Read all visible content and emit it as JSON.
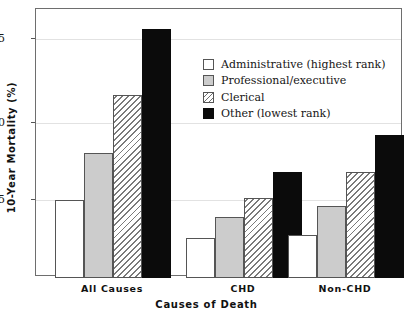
{
  "chart_data": {
    "type": "bar",
    "title": "",
    "xlabel": "Causes of Death",
    "ylabel": "10-Year Mortality (%)",
    "categories": [
      "All Causes",
      "CHD",
      "Non-CHD"
    ],
    "series": [
      {
        "name": "Administrative (highest rank)",
        "color": "#ffffff",
        "fill": "solid-white",
        "values": [
          4.9,
          2.5,
          2.7
        ]
      },
      {
        "name": "Professional/executive",
        "color": "#cccccc",
        "fill": "solid-gray",
        "values": [
          7.8,
          3.8,
          4.5
        ]
      },
      {
        "name": "Clerical",
        "color": "#ffffff",
        "fill": "diagonal-hatch",
        "values": [
          11.4,
          5.0,
          6.6
        ]
      },
      {
        "name": "Other (lowest rank)",
        "color": "#0b0b0b",
        "fill": "solid-black",
        "values": [
          15.5,
          6.6,
          8.9
        ]
      }
    ],
    "ylim": [
      0,
      16.7
    ],
    "yticks": [
      5,
      10,
      15
    ],
    "ytick_labels": [
      "5",
      "10",
      "15"
    ],
    "grid": "horizontal-only",
    "legend_position": "upper-center"
  },
  "legend": {
    "entries": [
      {
        "label": "Administrative (highest rank)",
        "swatch": "admin"
      },
      {
        "label": "Professional/executive",
        "swatch": "prof"
      },
      {
        "label": "Clerical",
        "swatch": "cler"
      },
      {
        "label": "Other (lowest rank)",
        "swatch": "other"
      }
    ]
  },
  "axes": {
    "y_title": "10-Year Mortality (%)",
    "x_title": "Causes of Death",
    "y_ticks": [
      "5",
      "10",
      "15"
    ],
    "x_ticks": [
      "All Causes",
      "CHD",
      "Non-CHD"
    ]
  },
  "colors": {
    "frame": "#6e6e6e",
    "grid": "#e2e2e2",
    "bar_outline": "#555555",
    "admin": "#ffffff",
    "professional": "#cccccc",
    "clerical_hatch": "#7a7a7a",
    "other": "#0b0b0b",
    "text": "#111111"
  }
}
